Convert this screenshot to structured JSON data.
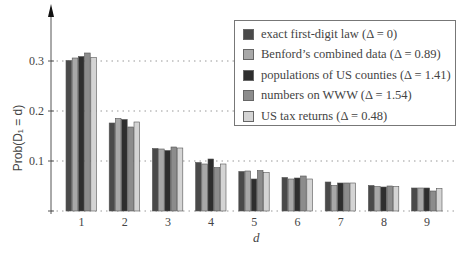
{
  "chart_data": {
    "type": "bar",
    "title": "",
    "xlabel": "d",
    "ylabel": "Prob(D1 = d)",
    "ylim": [
      0,
      0.36
    ],
    "yticks": [
      0.1,
      0.2,
      0.3
    ],
    "ytick_labels": [
      "0.1",
      "0.2",
      "0.3"
    ],
    "grid": "horizontal dotted at 0.1, 0.2, 0.3",
    "legend_position": "upper right",
    "categories": [
      "1",
      "2",
      "3",
      "4",
      "5",
      "6",
      "7",
      "8",
      "9"
    ],
    "series": [
      {
        "name": "exact first-digit law (Δ = 0)",
        "color": "#4a4a4a",
        "values": [
          0.301,
          0.176,
          0.125,
          0.097,
          0.079,
          0.067,
          0.058,
          0.051,
          0.046
        ]
      },
      {
        "name": "Benford's combined data (Δ = 0.89)",
        "color": "#a8a8a8",
        "values": [
          0.306,
          0.185,
          0.124,
          0.094,
          0.08,
          0.064,
          0.051,
          0.049,
          0.046
        ]
      },
      {
        "name": "populations of US counties (Δ = 1.41)",
        "color": "#2e2e2e",
        "values": [
          0.309,
          0.183,
          0.121,
          0.104,
          0.064,
          0.066,
          0.056,
          0.048,
          0.046
        ]
      },
      {
        "name": "numbers on WWW (Δ = 1.54)",
        "color": "#8c8c8c",
        "values": [
          0.316,
          0.168,
          0.128,
          0.087,
          0.081,
          0.07,
          0.056,
          0.05,
          0.04
        ]
      },
      {
        "name": "US tax returns (Δ = 0.48)",
        "color": "#d4d4d4",
        "values": [
          0.307,
          0.178,
          0.126,
          0.094,
          0.077,
          0.064,
          0.056,
          0.049,
          0.045
        ]
      }
    ]
  },
  "legend": {
    "items": [
      {
        "label": "exact first-digit law (Δ = 0)",
        "color": "#4a4a4a"
      },
      {
        "label": "Benford’s combined data (Δ = 0.89)",
        "color": "#a8a8a8"
      },
      {
        "label": "populations of US counties (Δ = 1.41)",
        "color": "#2e2e2e"
      },
      {
        "label": "numbers on WWW (Δ = 1.54)",
        "color": "#8c8c8c"
      },
      {
        "label": "US tax returns (Δ = 0.48)",
        "color": "#d4d4d4"
      }
    ]
  },
  "axes": {
    "ylabel": "Prob(D₁ = d)",
    "xlabel": "d"
  }
}
